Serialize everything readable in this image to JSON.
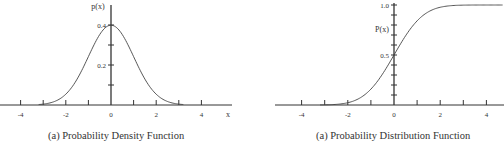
{
  "chart_data": [
    {
      "type": "line",
      "title": "Probability Density Function",
      "caption": "(a) Probability Density Function",
      "xlabel": "x",
      "ylabel": "p(x)",
      "xlim": [
        -5,
        5
      ],
      "ylim": [
        0,
        0.45
      ],
      "x_ticks": [
        -4,
        -3,
        -2,
        -1,
        0,
        1,
        2,
        3,
        4
      ],
      "x_tick_labels": [
        "-4",
        "-2",
        "0",
        "2",
        "4"
      ],
      "y_ticks": [
        0.1,
        0.2,
        0.3,
        0.4
      ],
      "y_tick_labels": [
        "0.2",
        "0.4"
      ],
      "grid": false,
      "series": [
        {
          "name": "standard normal pdf",
          "x": [
            -3,
            -2.5,
            -2,
            -1.5,
            -1,
            -0.5,
            0,
            0.5,
            1,
            1.5,
            2,
            2.5,
            3
          ],
          "y": [
            0.004,
            0.018,
            0.054,
            0.13,
            0.242,
            0.352,
            0.399,
            0.352,
            0.242,
            0.13,
            0.054,
            0.018,
            0.004
          ]
        }
      ]
    },
    {
      "type": "line",
      "title": "Probability Distribution Function",
      "caption": "(a) Probability Distribution Function",
      "xlabel": "",
      "ylabel": "P(x)",
      "xlim": [
        -5,
        5
      ],
      "ylim": [
        0,
        1.0
      ],
      "x_ticks": [
        -4,
        -3,
        -2,
        -1,
        0,
        1,
        2,
        3,
        4
      ],
      "x_tick_labels": [
        "-4",
        "-2",
        "0",
        "2",
        "4"
      ],
      "y_ticks": [
        0.1,
        0.2,
        0.3,
        0.4,
        0.5,
        0.6,
        0.7,
        0.8,
        0.9,
        1.0
      ],
      "y_tick_labels": [
        "0.5",
        "1.0"
      ],
      "grid": false,
      "series": [
        {
          "name": "cumulative distribution",
          "x": [
            -3,
            -2.5,
            -2,
            -1.5,
            -1,
            -0.5,
            0,
            0.5,
            1,
            1.5,
            2,
            2.5,
            3,
            4.5
          ],
          "y": [
            0.0,
            0.01,
            0.03,
            0.08,
            0.16,
            0.32,
            0.5,
            0.68,
            0.84,
            0.93,
            0.98,
            1.0,
            1.0,
            1.0
          ]
        }
      ]
    }
  ]
}
